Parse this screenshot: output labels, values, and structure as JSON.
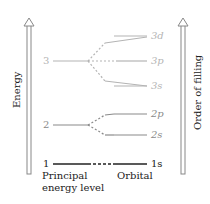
{
  "diagram": {
    "axes": {
      "left_label": "Energy",
      "right_label": "Order of filling"
    },
    "principal_levels": [
      {
        "n": "1",
        "color": "#222222"
      },
      {
        "n": "2",
        "color": "#8a8a8a"
      },
      {
        "n": "3",
        "color": "#b4b4b4"
      }
    ],
    "orbitals": [
      {
        "label": "1s",
        "level": "1",
        "color": "#222222"
      },
      {
        "label": "2s",
        "level": "2",
        "color": "#8a8a8a"
      },
      {
        "label": "2p",
        "level": "2",
        "color": "#8a8a8a"
      },
      {
        "label": "3s",
        "level": "3",
        "color": "#b4b4b4"
      },
      {
        "label": "3p",
        "level": "3",
        "color": "#b4b4b4"
      },
      {
        "label": "3d",
        "level": "3",
        "color": "#b4b4b4"
      }
    ],
    "footer": {
      "principal_caption_line1": "Principal",
      "principal_caption_line2": "energy level",
      "orbital_caption": "Orbital"
    }
  }
}
